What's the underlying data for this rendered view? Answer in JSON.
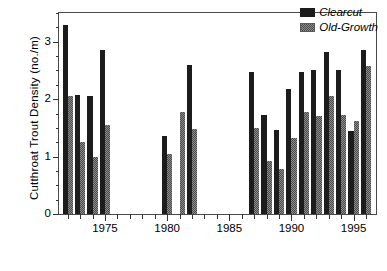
{
  "chart_data": {
    "type": "bar",
    "title": "",
    "xlabel": "",
    "ylabel": "Cutthroat Trout Density (no./m)",
    "ylim": [
      0,
      3.5
    ],
    "yticks": [
      0,
      1,
      2,
      3
    ],
    "ytick_labels": [
      "0",
      "1",
      "2",
      "3"
    ],
    "y_minor_step": 0.25,
    "xlim": [
      1971.3,
      1996.8
    ],
    "xticks": [
      1975,
      1980,
      1985,
      1990,
      1995
    ],
    "xtick_labels": [
      "1975",
      "1980",
      "1985",
      "1990",
      "1995"
    ],
    "x_minor_years": [
      1972,
      1973,
      1974,
      1976,
      1977,
      1978,
      1979,
      1981,
      1982,
      1983,
      1984,
      1986,
      1987,
      1988,
      1989,
      1991,
      1992,
      1993,
      1994,
      1996
    ],
    "grid": false,
    "legend_position": "top-right",
    "categories": [
      1972,
      1973,
      1974,
      1975,
      1980,
      1981,
      1982,
      1987,
      1988,
      1989,
      1990,
      1991,
      1992,
      1993,
      1994,
      1995,
      1996
    ],
    "series": [
      {
        "name": "Clearcut",
        "color": "#1c1c1c",
        "values": [
          3.3,
          2.07,
          2.05,
          2.85,
          1.35,
          null,
          2.6,
          2.47,
          1.72,
          1.47,
          2.18,
          2.48,
          2.5,
          2.82,
          2.5,
          1.45,
          2.85
        ]
      },
      {
        "name": "Old-Growth",
        "color": "#8d8d8d",
        "values": [
          2.05,
          1.25,
          1.0,
          1.55,
          1.05,
          1.78,
          1.48,
          1.5,
          0.92,
          0.78,
          1.32,
          1.78,
          1.7,
          2.05,
          1.72,
          1.62,
          2.57
        ]
      }
    ],
    "legend": [
      {
        "label": "Clearcut",
        "swatch": "solid-black"
      },
      {
        "label": "Old-Growth",
        "swatch": "gray-stipple"
      }
    ],
    "gaps": [
      "1976-1979",
      "1983-1986"
    ]
  }
}
